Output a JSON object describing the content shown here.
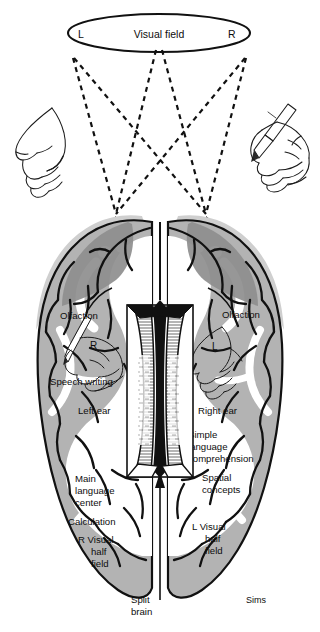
{
  "figure": {
    "title_text": "Visual field",
    "artist_signature": "Sims",
    "caption_bottom": "Split brain",
    "colors": {
      "ink": "#0d0d0d",
      "cortex_gray": "#b3b3b3",
      "halo_gray": "#cfcfcf",
      "occipital_dark_gray": "#8e8e8e",
      "white_matter": "#ffffff",
      "background": "#ffffff"
    }
  },
  "visual_field": {
    "label": "Visual field",
    "left_marker": "L",
    "right_marker": "R"
  },
  "hands": {
    "left_hand_label": "",
    "right_hand_label": ""
  },
  "left_hemisphere": {
    "labels": [
      {
        "id": "olfaction-left",
        "text": "Olfaction"
      },
      {
        "id": "hand-marker-r",
        "text": "R"
      },
      {
        "id": "speech-writing",
        "text": "Speech writing"
      },
      {
        "id": "left-ear",
        "text": "Left ear"
      },
      {
        "id": "main-language-center",
        "text": "Main\nlanguage\ncenter"
      },
      {
        "id": "calculation",
        "text": "Calculation"
      },
      {
        "id": "visual-half-field-r",
        "text": "R  Visual\nhalf\nfield"
      }
    ],
    "main_language_center_lines": [
      "Main",
      "language",
      "center"
    ],
    "visual_half_field_lines": [
      "R  Visual",
      "half",
      "field"
    ]
  },
  "right_hemisphere": {
    "labels": [
      {
        "id": "olfaction-right",
        "text": "Olfaction"
      },
      {
        "id": "hand-marker-l",
        "text": "L"
      },
      {
        "id": "right-ear",
        "text": "Right ear"
      },
      {
        "id": "simple-language-comprehension",
        "text": "Simple\nlanguage\ncomprehension"
      },
      {
        "id": "spatial-concepts",
        "text": "Spatial\nconcepts"
      },
      {
        "id": "visual-half-field-l",
        "text": "L  Visual\nhalf\nfield"
      }
    ],
    "simple_language_lines": [
      "Simple",
      "language",
      "comprehension"
    ],
    "spatial_concepts_lines": [
      "Spatial",
      "concepts"
    ],
    "visual_half_field_lines": [
      "L  Visual",
      "half",
      "field"
    ]
  },
  "corpus_callosum": {
    "caption_line1": "Split",
    "caption_line2": "brain"
  }
}
